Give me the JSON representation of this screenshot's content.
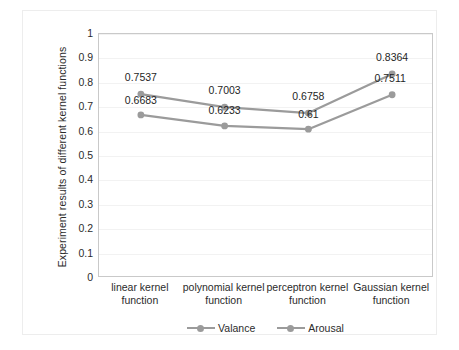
{
  "chart_data": {
    "type": "line",
    "title": "",
    "xlabel": "",
    "ylabel": "Experiment results of  different kernel functions",
    "ylim": [
      0,
      1
    ],
    "grid": true,
    "legend_position": "bottom",
    "categories": [
      "linear kernel function",
      "polynomial kernel function",
      "perceptron kernel function",
      "Gaussian kernel function"
    ],
    "category_lines": [
      [
        "linear kernel",
        "function"
      ],
      [
        "polynomial kernel",
        "function"
      ],
      [
        "perceptron kernel",
        "function"
      ],
      [
        "Gaussian kernel",
        "function"
      ]
    ],
    "yticks": [
      "0",
      "0.1",
      "0.2",
      "0.3",
      "0.4",
      "0.5",
      "0.6",
      "0.7",
      "0.8",
      "0.9",
      "1"
    ],
    "series": [
      {
        "name": "Valance",
        "color": "#9b9b9b",
        "values": [
          0.7537,
          0.7003,
          0.6758,
          0.8364
        ],
        "labels": [
          "0.7537",
          "0.7003",
          "0.6758",
          "0.8364"
        ]
      },
      {
        "name": "Arousal",
        "color": "#9b9b9b",
        "values": [
          0.6683,
          0.6233,
          0.61,
          0.7511
        ],
        "labels": [
          "0.6683",
          "0.6233",
          "0.61",
          "0.7511"
        ]
      }
    ]
  },
  "colors": {
    "series": "#9b9b9b",
    "gridline": "#f2f2f2",
    "plot_border": "#c9c9c9",
    "outer_frame": "#ededed",
    "text": "#2b2b2b"
  }
}
